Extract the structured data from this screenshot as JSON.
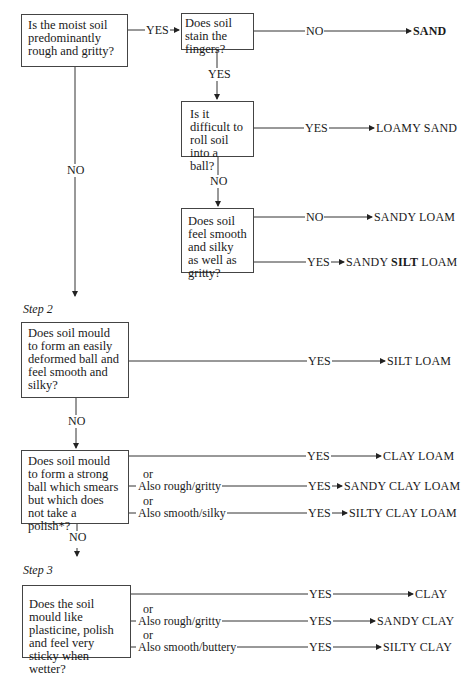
{
  "step1": {
    "q_rough": "Is the moist soil predominantly rough and gritty?",
    "q_stain": "Does soil stain the fingers?",
    "q_roll": "Is it difficult to roll soil into a ball?",
    "q_silky": "Does soil feel smooth and silky as well as gritty?",
    "yes": "YES",
    "no": "NO",
    "results": {
      "sand": "SAND",
      "loamy_sand": "LOAMY SAND",
      "sandy_loam": "SANDY LOAM",
      "sandy_silt_loam_a": "SANDY ",
      "sandy_silt_loam_b": "SILT",
      "sandy_silt_loam_c": " LOAM"
    }
  },
  "step2": {
    "label": "Step 2",
    "q_silt": "Does soil mould to form an easily deformed ball and feel smooth and silky?",
    "q_clay_loam": "Does soil mould to form a strong ball which smears but which does not take a polish*?",
    "or": "or",
    "also_rough": "Also rough/gritty",
    "also_smooth": "Also smooth/silky",
    "results": {
      "silt_loam": "SILT LOAM",
      "clay_loam": "CLAY LOAM",
      "sandy_clay_loam": "SANDY CLAY LOAM",
      "silty_clay_loam": "SILTY CLAY LOAM"
    }
  },
  "step3": {
    "label": "Step 3",
    "q_clay": "Does the soil mould like plasticine, polish and feel very sticky when wetter?",
    "or": "or",
    "also_rough": "Also rough/gritty",
    "also_smooth": "Also smooth/buttery",
    "results": {
      "clay": "CLAY",
      "sandy_clay": "SANDY CLAY",
      "silty_clay": "SILTY CLAY"
    }
  }
}
